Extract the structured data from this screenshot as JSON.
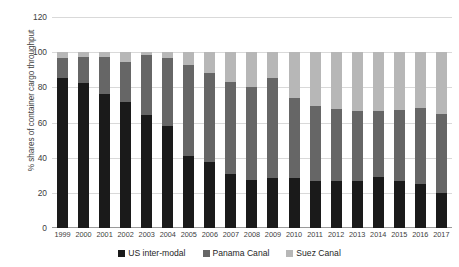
{
  "chart_data": {
    "type": "bar",
    "subtype": "stacked-bar",
    "title": "",
    "xlabel": "",
    "ylabel": "% shares of container cargo throughput",
    "ylim": [
      0,
      120
    ],
    "yticks": [
      0,
      20,
      40,
      60,
      80,
      100,
      120
    ],
    "grid": true,
    "legend_position": "bottom",
    "categories": [
      "1999",
      "2000",
      "2001",
      "2002",
      "2003",
      "2004",
      "2005",
      "2006",
      "2007",
      "2008",
      "2009",
      "2010",
      "2011",
      "2012",
      "2013",
      "2014",
      "2015",
      "2016",
      "2017"
    ],
    "series": [
      {
        "name": "US inter-modal",
        "color": "#1a1a1a",
        "values": [
          85.5,
          82.5,
          76.5,
          71.5,
          64.0,
          58.0,
          41.0,
          37.5,
          31.0,
          27.5,
          28.5,
          28.5,
          27.0,
          27.0,
          26.5,
          29.0,
          26.5,
          25.0,
          20.0
        ]
      },
      {
        "name": "Panama Canal",
        "color": "#666666",
        "values": [
          11.0,
          15.0,
          21.0,
          23.0,
          34.5,
          38.5,
          52.0,
          50.5,
          52.0,
          52.5,
          57.0,
          45.5,
          42.5,
          40.5,
          40.0,
          37.5,
          40.5,
          43.0,
          45.0
        ]
      },
      {
        "name": "Suez Canal",
        "color": "#b7b7b7",
        "values": [
          3.5,
          2.5,
          2.5,
          5.5,
          1.5,
          3.5,
          7.0,
          12.0,
          17.0,
          20.0,
          14.5,
          26.0,
          30.5,
          32.5,
          33.5,
          33.5,
          33.0,
          32.0,
          35.0
        ]
      }
    ]
  },
  "axis": {
    "y_title": "% shares of container cargo throughput",
    "y_tick_labels": [
      "0",
      "20",
      "40",
      "60",
      "80",
      "100",
      "120"
    ]
  },
  "legend": {
    "items": [
      {
        "label": "US inter-modal",
        "color": "#1a1a1a"
      },
      {
        "label": "Panama Canal",
        "color": "#666666"
      },
      {
        "label": "Suez Canal",
        "color": "#b7b7b7"
      }
    ]
  }
}
